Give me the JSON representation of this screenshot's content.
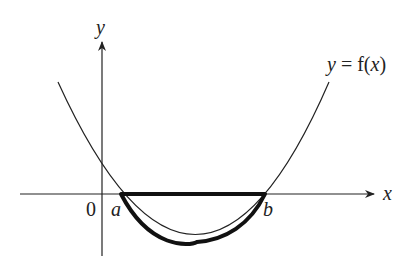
{
  "diagram": {
    "type": "function graph",
    "axes": {
      "x_label": "x",
      "y_label": "y",
      "origin_label": "0"
    },
    "curve_label": "y = f(x)",
    "curve_label_parts": {
      "y": "y",
      "eq": " = f(",
      "x": "x",
      "close": ")"
    },
    "points": {
      "a": "a",
      "b": "b"
    },
    "highlight": "Interval [a, b] on the x-axis and the portion of the curve below the x-axis between a and b are drawn in bold",
    "colors": {
      "line": "#222222",
      "background": "#ffffff"
    }
  }
}
